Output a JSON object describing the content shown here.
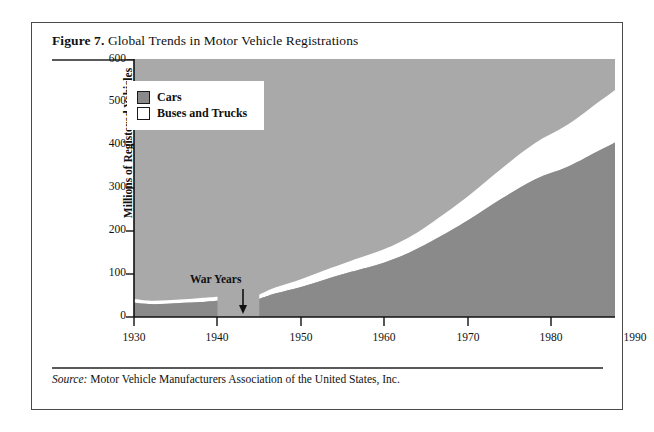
{
  "figure": {
    "label": "Figure 7.",
    "title": " Global Trends in Motor Vehicle Registrations",
    "source_label": "Source:",
    "source_text": " Motor Vehicle Manufacturers Association of the United States, Inc."
  },
  "colors": {
    "plot_background": "#a9a9a9",
    "cars_fill": "#8a8a8a",
    "buses_trucks_fill": "#ffffff",
    "axis": "#111111",
    "frame_border": "#4a4a4a",
    "page_background": "#ffffff"
  },
  "chart_data": {
    "type": "area",
    "stacked": true,
    "title": "Global Trends in Motor Vehicle Registrations",
    "xlabel": "",
    "ylabel": "Millions of Registered Vehicles",
    "xlim": [
      1930,
      1990
    ],
    "ylim": [
      0,
      600
    ],
    "xticks": [
      1930,
      1940,
      1950,
      1960,
      1970,
      1980,
      1990
    ],
    "yticks": [
      0,
      100,
      200,
      300,
      400,
      500,
      600
    ],
    "grid": false,
    "legend_position": "upper-left-inside",
    "data_gap": {
      "label": "War Years",
      "start": 1942,
      "end": 1945,
      "annotation_arrow": "down-arrow"
    },
    "series": [
      {
        "name": "Cars",
        "color": "#8a8a8a",
        "x": [
          1930,
          1932,
          1934,
          1936,
          1938,
          1940,
          1942,
          1945,
          1947,
          1950,
          1953,
          1956,
          1960,
          1963,
          1966,
          1970,
          1974,
          1978,
          1982,
          1986,
          1989
        ],
        "values": [
          33,
          30,
          31,
          33,
          35,
          38,
          40,
          42,
          55,
          70,
          88,
          105,
          127,
          150,
          180,
          225,
          275,
          320,
          350,
          390,
          420
        ]
      },
      {
        "name": "Buses and Trucks",
        "color": "#ffffff",
        "x": [
          1930,
          1932,
          1934,
          1936,
          1938,
          1940,
          1942,
          1945,
          1947,
          1950,
          1953,
          1956,
          1960,
          1963,
          1966,
          1970,
          1974,
          1978,
          1982,
          1986,
          1989
        ],
        "values": [
          9,
          8,
          8,
          8,
          9,
          9,
          10,
          10,
          14,
          18,
          22,
          26,
          31,
          36,
          44,
          56,
          70,
          84,
          98,
          115,
          128
        ]
      }
    ],
    "totals": {
      "name": "Total registered vehicles",
      "x": [
        1930,
        1932,
        1934,
        1936,
        1938,
        1940,
        1942,
        1945,
        1947,
        1950,
        1953,
        1956,
        1960,
        1963,
        1966,
        1970,
        1974,
        1978,
        1982,
        1986,
        1989
      ],
      "values": [
        42,
        38,
        39,
        41,
        44,
        47,
        50,
        52,
        69,
        88,
        110,
        131,
        158,
        186,
        224,
        281,
        345,
        404,
        448,
        505,
        548
      ]
    }
  },
  "legend": {
    "items": [
      {
        "label": "Cars",
        "swatch": "#8a8a8a"
      },
      {
        "label": "Buses and Trucks",
        "swatch": "#ffffff"
      }
    ]
  },
  "axes": {
    "y_title": "Millions of Registered Vehicles",
    "y_labels": [
      "600",
      "500",
      "400",
      "300",
      "200",
      "100",
      "0"
    ],
    "x_labels": [
      "1930",
      "1940",
      "1950",
      "1960",
      "1970",
      "1980",
      "1990"
    ]
  },
  "annotations": {
    "war_years": "War Years"
  }
}
